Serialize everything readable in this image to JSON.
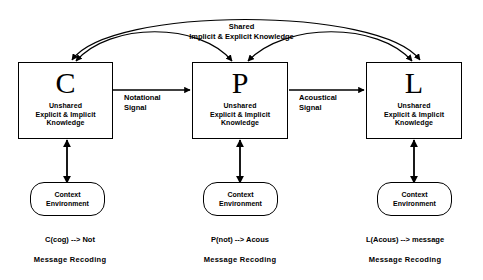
{
  "diagram": {
    "title_note": "Three-stage knowledge recoding diagram",
    "shared_curve": {
      "line1": "Shared",
      "line2": "Implicit & Explicit Knowledge"
    },
    "nodes": [
      {
        "id": "cognitive",
        "letter": "C",
        "sub_line1": "Unshared",
        "sub_line2": "Explicit & Implicit",
        "sub_line3": "Knowledge",
        "context_line1": "Context",
        "context_line2": "Environment",
        "caption_line1": "C(cog) --> Not",
        "caption_line2": "Message  Recoding"
      },
      {
        "id": "notational",
        "letter": "P",
        "sub_line1": "Unshared",
        "sub_line2": "Explicit & Implicit",
        "sub_line3": "Knowledge",
        "context_line1": "Context",
        "context_line2": "Environment",
        "caption_line1": "P(not) --> Acous",
        "caption_line2": "Message  Recoding"
      },
      {
        "id": "acoustical",
        "letter": "L",
        "sub_line1": "Unshared",
        "sub_line2": "Explicit & Implicit",
        "sub_line3": "Knowledge",
        "context_line1": "Context",
        "context_line2": "Environment",
        "caption_line1": "L(Acous) --> message",
        "caption_line2": "Message  Recoding"
      }
    ],
    "connectors": [
      {
        "id": "c-to-p",
        "line1": "Notational",
        "line2": "Signal"
      },
      {
        "id": "p-to-l",
        "line1": "Acoustical",
        "line2": "Signal"
      }
    ],
    "colors": {
      "stroke": "#000000",
      "background": "#ffffff",
      "text": "#000000"
    }
  }
}
